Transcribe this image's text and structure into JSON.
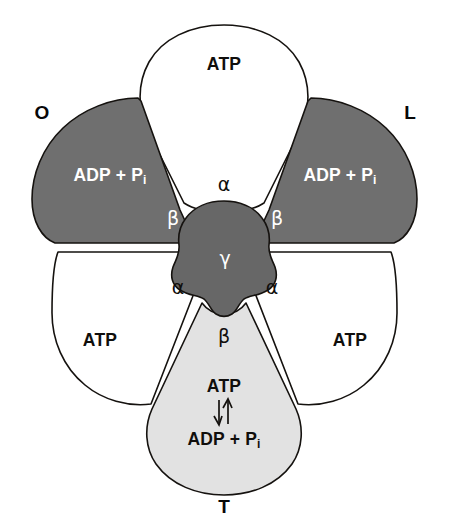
{
  "figure": {
    "background_color": "#ffffff",
    "outline_color": "#15120f"
  },
  "colors": {
    "dark_gray_subunit": "#6f6f6f",
    "light_gray_subunit": "#e2e2e2",
    "white_subunit": "#ffffff",
    "gamma_gray": "#676767",
    "text_dark": "#100e0c",
    "text_white": "#ffffff"
  },
  "state_labels": [
    {
      "id": "o",
      "text": "O",
      "meaning": "open"
    },
    {
      "id": "l",
      "text": "L",
      "meaning": "loose"
    },
    {
      "id": "t",
      "text": "T",
      "meaning": "tight"
    }
  ],
  "subunits": {
    "alpha_top": {
      "greek": "α",
      "content": "ATP",
      "fill": "white"
    },
    "alpha_bottom_left": {
      "greek": "α",
      "content": "ATP",
      "fill": "white"
    },
    "alpha_bottom_right": {
      "greek": "α",
      "content": "ATP",
      "fill": "white"
    },
    "beta_o": {
      "greek": "β",
      "content": "ADP + P",
      "content_subscript": "i",
      "fill": "dark-gray",
      "state": "O"
    },
    "beta_l": {
      "greek": "β",
      "content": "ADP + P",
      "content_subscript": "i",
      "fill": "dark-gray",
      "state": "L"
    },
    "beta_t": {
      "greek": "β",
      "content_top": "ATP",
      "content_bottom": "ADP + P",
      "content_bottom_subscript": "i",
      "equilibrium_arrow": "⇅",
      "fill": "light-gray",
      "state": "T"
    },
    "gamma": {
      "greek": "γ",
      "fill": "gamma-gray"
    }
  }
}
